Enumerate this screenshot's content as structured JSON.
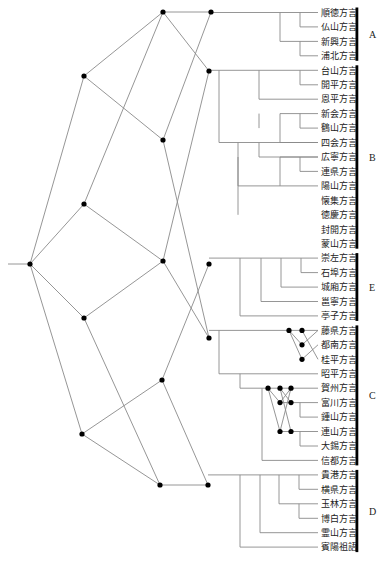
{
  "diagram": {
    "type": "phylogenetic-network",
    "groups": [
      {
        "id": "A",
        "label": "A",
        "leaves": [
          "順徳方言",
          "仏山方言",
          "新興方言",
          "浦北方言"
        ]
      },
      {
        "id": "B",
        "label": "B",
        "leaves": [
          "台山方言",
          "開平方言",
          "恩平方言",
          "新会方言",
          "鶴山方言",
          "四会方言",
          "広寧方言",
          "連県方言",
          "陽山方言",
          "懐集方言",
          "徳慶方言",
          "封開方言",
          "蒙山方言"
        ]
      },
      {
        "id": "E",
        "label": "E",
        "leaves": [
          "崇左方言",
          "石埠方言",
          "城廂方言",
          "邕寧方言",
          "亭子方言"
        ]
      },
      {
        "id": "C",
        "label": "C",
        "leaves": [
          "藤県方言",
          "都南方言",
          "桂平方言",
          "昭平方言",
          "賀州方言",
          "富川方言",
          "鍾山方言",
          "連山方言",
          "大錫方言",
          "信都方言"
        ]
      },
      {
        "id": "D",
        "label": "D",
        "leaves": [
          "貴港方言",
          "横県方言",
          "玉林方言",
          "博白方言",
          "霊山方言",
          "賓陽祖語"
        ]
      }
    ],
    "colors": {
      "edge": "#8a8a8a",
      "node": "#000000",
      "bar": "#000000",
      "text": "#222222",
      "background": "#ffffff"
    }
  }
}
